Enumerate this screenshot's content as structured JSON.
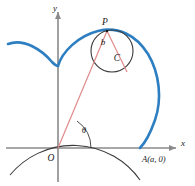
{
  "figure": {
    "labels": {
      "x_axis": "x",
      "y_axis": "y",
      "origin": "O",
      "point_P": "P",
      "circle_center": "C",
      "radius_b": "b",
      "angle_theta": "θ",
      "point_A": "A(a, 0)"
    },
    "colors": {
      "curve_blue": "#2e7fc1",
      "ray_red": "#e08a8a",
      "axis_gray": "#8a8a8a",
      "circle_black": "#3a3a3a",
      "text_black": "#1a1a1a"
    },
    "geometry": {
      "origin_px": [
        58,
        148
      ],
      "point_A_px": [
        140,
        148
      ],
      "point_P_px": [
        107,
        31
      ],
      "circle_C_center_px": [
        112,
        51
      ],
      "circle_C_radius_px": 21,
      "fixed_circle_center_px": [
        58,
        148
      ],
      "fixed_circle_radius_px": 82,
      "theta_arc_radius_px": 33,
      "theta_degrees": 55
    }
  }
}
